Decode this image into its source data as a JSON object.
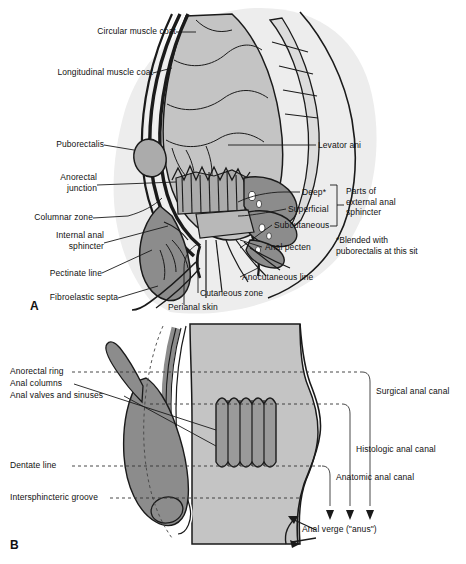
{
  "figure": {
    "panel_a_letter": "A",
    "panel_b_letter": "B"
  },
  "colors": {
    "light_gray": "#c4c4c4",
    "mid_gray": "#ababab",
    "dark_gray": "#8c8c8c",
    "pale_gray": "#e2e2e2",
    "outline": "#1a1a1a",
    "white": "#ffffff",
    "text": "#111111"
  },
  "panel_a": {
    "labels_left": [
      {
        "name": "circular-muscle-coat",
        "text": "Circular muscle coat"
      },
      {
        "name": "longitudinal-muscle-coat",
        "text": "Longitudinal muscle coat"
      },
      {
        "name": "puborectalis",
        "text": "Puborectalis"
      },
      {
        "name": "anorectal-junction",
        "text": "Anorectal\njunction"
      },
      {
        "name": "columnar-zone",
        "text": "Columnar zone"
      },
      {
        "name": "internal-anal-sphincter",
        "text": "Internal anal\nsphincter"
      },
      {
        "name": "pectinate-line",
        "text": "Pectinate line"
      },
      {
        "name": "fibroelastic-septa",
        "text": "Fibroelastic septa"
      }
    ],
    "labels_bottom": [
      {
        "name": "perianal-skin",
        "text": "Perianal skin"
      },
      {
        "name": "cutaneous-zone",
        "text": "Cutaneous zone"
      },
      {
        "name": "anocutaneous-line",
        "text": "Anocutaneous line"
      }
    ],
    "labels_right": [
      {
        "name": "levator-ani",
        "text": "Levator ani"
      },
      {
        "name": "deep",
        "text": "Deep*"
      },
      {
        "name": "superficial",
        "text": "Superficial"
      },
      {
        "name": "subcutaneous",
        "text": "Subcutaneous"
      },
      {
        "name": "anal-pecten",
        "text": "Anal pecten"
      }
    ],
    "brace_label": "Parts of\nexternal anal\nsphincter",
    "footnote": "*Blended with\npuborectalis at this sit"
  },
  "panel_b": {
    "labels_left": [
      {
        "name": "anorectal-ring",
        "text": "Anorectal ring"
      },
      {
        "name": "anal-columns",
        "text": "Anal columns"
      },
      {
        "name": "anal-valves-and-sinuses",
        "text": "Anal valves and sinuses"
      },
      {
        "name": "dentate-line",
        "text": "Dentate line"
      },
      {
        "name": "intersphincteric-groove",
        "text": "Intersphincteric groove"
      }
    ],
    "labels_right": [
      {
        "name": "surgical-anal-canal",
        "text": "Surgical anal canal"
      },
      {
        "name": "histologic-anal-canal",
        "text": "Histologic anal canal"
      },
      {
        "name": "anatomic-anal-canal",
        "text": "Anatomic anal canal"
      }
    ],
    "anal_verge_label": "Anal verge (\"anus\")"
  }
}
